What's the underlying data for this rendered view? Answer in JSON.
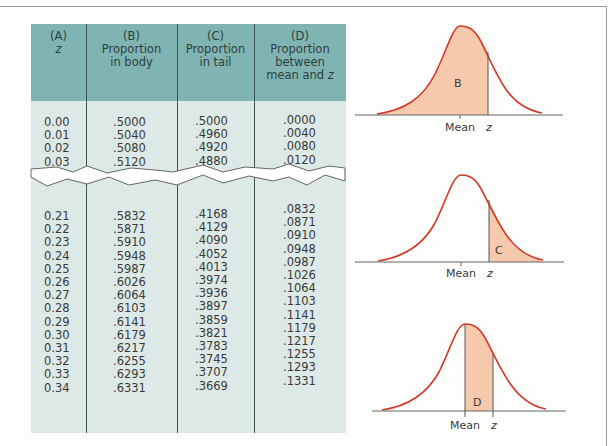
{
  "table": {
    "headers": [
      {
        "letter": "(A)",
        "line1": "z",
        "line2": "",
        "line3": ""
      },
      {
        "letter": "(B)",
        "line1": "Proportion",
        "line2": "in body",
        "line3": ""
      },
      {
        "letter": "(C)",
        "line1": "Proportion",
        "line2": "in tail",
        "line3": ""
      },
      {
        "letter": "(D)",
        "line1": "Proportion",
        "line2": "between",
        "line3": "mean and z"
      }
    ],
    "top_rows": [
      {
        "z": "0.00",
        "body": ".5000",
        "tail": ".5000",
        "between": ".0000"
      },
      {
        "z": "0.01",
        "body": ".5040",
        "tail": ".4960",
        "between": ".0040"
      },
      {
        "z": "0.02",
        "body": ".5080",
        "tail": ".4920",
        "between": ".0080"
      },
      {
        "z": "0.03",
        "body": ".5120",
        "tail": ".4880",
        "between": ".0120"
      }
    ],
    "bottom_rows": [
      {
        "z": "0.21",
        "body": ".5832",
        "tail": ".4168",
        "between": ".0832"
      },
      {
        "z": "0.22",
        "body": ".5871",
        "tail": ".4129",
        "between": ".0871"
      },
      {
        "z": "0.23",
        "body": ".5910",
        "tail": ".4090",
        "between": ".0910"
      },
      {
        "z": "0.24",
        "body": ".5948",
        "tail": ".4052",
        "between": ".0948"
      },
      {
        "z": "0.25",
        "body": ".5987",
        "tail": ".4013",
        "between": ".0987"
      },
      {
        "z": "0.26",
        "body": ".6026",
        "tail": ".3974",
        "between": ".1026"
      },
      {
        "z": "0.27",
        "body": ".6064",
        "tail": ".3936",
        "between": ".1064"
      },
      {
        "z": "0.28",
        "body": ".6103",
        "tail": ".3897",
        "between": ".1103"
      },
      {
        "z": "0.29",
        "body": ".6141",
        "tail": ".3859",
        "between": ".1141"
      },
      {
        "z": "0.30",
        "body": ".6179",
        "tail": ".3821",
        "between": ".1179"
      },
      {
        "z": "0.31",
        "body": ".6217",
        "tail": ".3783",
        "between": ".1217"
      },
      {
        "z": "0.32",
        "body": ".6255",
        "tail": ".3745",
        "between": ".1255"
      },
      {
        "z": "0.33",
        "body": ".6293",
        "tail": ".3707",
        "between": ".1293"
      },
      {
        "z": "0.34",
        "body": ".6331",
        "tail": ".3669",
        "between": ".1331"
      }
    ]
  },
  "diagrams": [
    {
      "region_label": "B",
      "mean_label": "Mean",
      "z_label": "z",
      "shading": "body"
    },
    {
      "region_label": "C",
      "mean_label": "Mean",
      "z_label": "z",
      "shading": "tail"
    },
    {
      "region_label": "D",
      "mean_label": "Mean",
      "z_label": "z",
      "shading": "between"
    }
  ],
  "colors": {
    "header_bg": "#7fb4b2",
    "body_bg": "#dde9e6",
    "curve": "#d03a2a",
    "shade": "#f6c9ad"
  }
}
